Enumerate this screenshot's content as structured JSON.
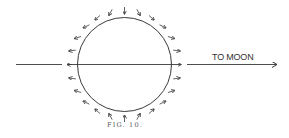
{
  "figure": {
    "caption": "FIG. 10.",
    "direction_label": "TO MOON",
    "colors": {
      "ink": "#3a3a3a",
      "background": "#ffffff"
    },
    "circle": {
      "cx": 124.5,
      "cy": 64.5,
      "r": 47
    },
    "axis_line_y": 64.5,
    "left_line": {
      "x1": 16,
      "x2": 62
    },
    "moon_arrow": {
      "x1": 187,
      "x2": 277
    },
    "force_arrow_count": 24
  }
}
